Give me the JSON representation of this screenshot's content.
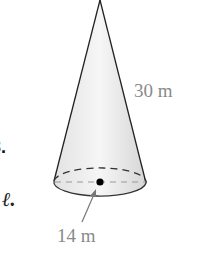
{
  "figure": {
    "shape": "cone",
    "slant_height_label": "30 m",
    "radius_label": "14 m",
    "colors": {
      "fill_light": "#f4f4f4",
      "fill_dark": "#d9d9d9",
      "outline": "#222222",
      "label": "#8a8a8a"
    }
  },
  "margin": {
    "problem_number": "3.",
    "variable_text": "ℓ."
  }
}
